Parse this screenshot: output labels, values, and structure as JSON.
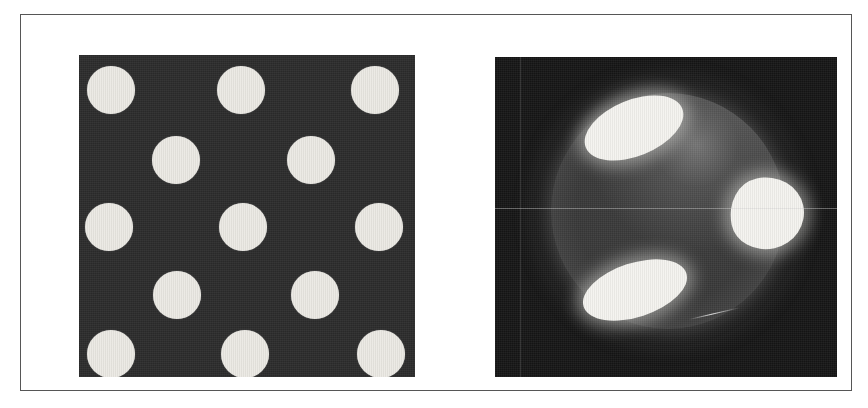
{
  "figure": {
    "title": "",
    "caption": "",
    "background_color": "#ffffff",
    "frame": {
      "border_color": "#565656",
      "border_width_px": 1,
      "x": 20,
      "y": 14,
      "width": 832,
      "height": 377
    }
  },
  "panels": [
    {
      "id": "panel-a",
      "name": "dot-pattern-panel",
      "label": "",
      "type": "image",
      "description": "dark square with white circular dots in a staggered quincunx grid",
      "x": 58,
      "y": 40,
      "width": 336,
      "height": 322,
      "background_color": "#2b2b2b",
      "dot_color": "#eceae4",
      "dot_diameter_px": 48,
      "rows": 5,
      "dots": [
        {
          "cx": 32,
          "cy": 35,
          "r": 24
        },
        {
          "cx": 162,
          "cy": 35,
          "r": 24
        },
        {
          "cx": 296,
          "cy": 35,
          "r": 24
        },
        {
          "cx": 97,
          "cy": 105,
          "r": 24
        },
        {
          "cx": 232,
          "cy": 105,
          "r": 24
        },
        {
          "cx": 30,
          "cy": 172,
          "r": 24
        },
        {
          "cx": 164,
          "cy": 172,
          "r": 24
        },
        {
          "cx": 300,
          "cy": 172,
          "r": 24
        },
        {
          "cx": 98,
          "cy": 240,
          "r": 24
        },
        {
          "cx": 236,
          "cy": 240,
          "r": 24
        },
        {
          "cx": 32,
          "cy": 299,
          "r": 24
        },
        {
          "cx": 166,
          "cy": 299,
          "r": 24
        },
        {
          "cx": 302,
          "cy": 299,
          "r": 24
        }
      ]
    },
    {
      "id": "panel-b",
      "name": "sphere-render-panel",
      "label": "",
      "type": "image",
      "description": "dark background with a shaded sphere bearing three bright elliptical patches",
      "x": 474,
      "y": 42,
      "width": 342,
      "height": 320,
      "background_color": "#151515",
      "sphere_color": "#3b3b3b",
      "spot_color": "#f4f3ef",
      "sphere": {
        "cx": 173,
        "cy": 154,
        "rx": 117,
        "ry": 118
      },
      "spots": [
        {
          "name": "upper-left-spot",
          "cx": 139,
          "cy": 71,
          "rx": 52,
          "ry": 28,
          "rotation_deg": -22
        },
        {
          "name": "right-spot",
          "cx": 272,
          "cy": 156,
          "rx": 37,
          "ry": 36,
          "rotation_deg": -12
        },
        {
          "name": "lower-left-spot",
          "cx": 140,
          "cy": 233,
          "rx": 54,
          "ry": 27,
          "rotation_deg": -18
        }
      ],
      "artifacts": [
        {
          "name": "horizontal-scan-line",
          "orientation": "horizontal",
          "y": 151
        },
        {
          "name": "vertical-scan-line",
          "orientation": "vertical",
          "x": 25
        },
        {
          "name": "diagonal-streak",
          "orientation": "diagonal",
          "x": 194,
          "y": 262,
          "length": 52,
          "angle_deg": -13
        }
      ]
    }
  ]
}
